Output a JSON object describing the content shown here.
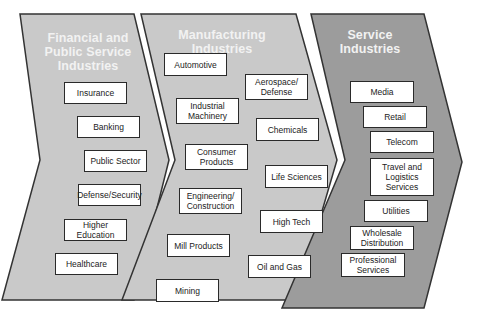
{
  "colors": {
    "panel_light": "#c8c8c8",
    "panel_dark": "#9a9a9a",
    "outline": "#333333",
    "title_text": "#f2f2f2",
    "box_fill": "#ffffff"
  },
  "panels": [
    {
      "title": "Financial and\nPublic Service\nIndustries",
      "items": [
        "Insurance",
        "Banking",
        "Public Sector",
        "Defense/Security",
        "Higher Education",
        "Healthcare"
      ]
    },
    {
      "title": "Manufacturing Industries",
      "items": [
        "Automotive",
        "Aerospace/\nDefense",
        "Industrial\nMachinery",
        "Chemicals",
        "Consumer\nProducts",
        "Life Sciences",
        "Engineering/\nConstruction",
        "High Tech",
        "Mill Products",
        "Oil and Gas",
        "Mining"
      ]
    },
    {
      "title": "Service Industries",
      "items": [
        "Media",
        "Retail",
        "Telecom",
        "Travel and\nLogistics\nServices",
        "Utilities",
        "Wholesale\nDistribution",
        "Professional\nServices"
      ]
    }
  ]
}
